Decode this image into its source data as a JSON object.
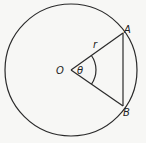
{
  "diagram": {
    "labels": {
      "center": "O",
      "point_a": "A",
      "point_b": "B",
      "radius": "r",
      "angle": "θ"
    },
    "colors": {
      "line": "#2a2a2a",
      "background": "#f7f7f5"
    }
  }
}
